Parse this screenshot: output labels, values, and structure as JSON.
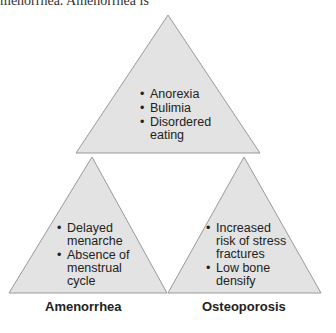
{
  "top_text": "menorrhea. Amenorrhea is",
  "triangles": {
    "top": {
      "items": [
        "Anorexia",
        "Bulimia",
        "Disordered eating"
      ]
    },
    "left": {
      "items": [
        "Delayed menarche",
        "Absence of menstrual cycle"
      ],
      "label": "Amenorrhea"
    },
    "right": {
      "items": [
        "Increased risk of stress fractures",
        "Low bone densify"
      ],
      "label": "Osteoporosis"
    }
  },
  "colors": {
    "fill": "#e3e3e3",
    "stroke": "#999999"
  }
}
